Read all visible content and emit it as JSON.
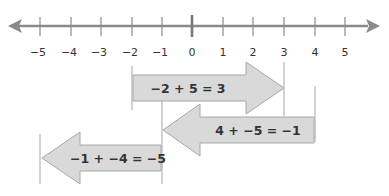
{
  "diagram": {
    "type": "number-line-addition",
    "colors": {
      "axis": "#8a8a8a",
      "zero_tick": "#7a7a7a",
      "guide_line": "#b5b5b5",
      "arrow_fill": "#d9d9d9",
      "arrow_stroke": "#a8a8a8",
      "text": "#333333"
    },
    "number_line": {
      "min": -5,
      "max": 5,
      "tick_labels": [
        "−5",
        "−4",
        "−3",
        "−2",
        "−1",
        "0",
        "1",
        "2",
        "3",
        "4",
        "5"
      ]
    },
    "arrows": [
      {
        "from": -2,
        "to": 3,
        "direction": "right",
        "label": "−2 + 5 = 3"
      },
      {
        "from": 4,
        "to": -1,
        "direction": "left",
        "label": "4 + −5 = −1"
      },
      {
        "from": -1,
        "to": -5,
        "direction": "left",
        "label": "−1 + −4 = −5"
      }
    ]
  }
}
